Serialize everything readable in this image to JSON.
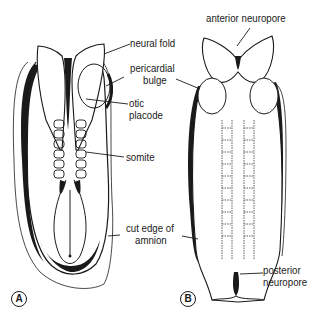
{
  "figure": {
    "panels": [
      {
        "id": "A",
        "letter": "A"
      },
      {
        "id": "B",
        "letter": "B"
      }
    ],
    "labels": {
      "neural_fold": "neural fold",
      "pericardial_bulge_1": "pericardial",
      "pericardial_bulge_2": "bulge",
      "otic_placode_1": "otic",
      "otic_placode_2": "placode",
      "somite": "somite",
      "cut_edge_1": "cut edge of",
      "cut_edge_2": "amnion",
      "anterior_neuropore": "anterior neuropore",
      "posterior_neuropore_1": "posterior",
      "posterior_neuropore_2": "neuropore"
    },
    "colors": {
      "ink": "#1a1a1a",
      "background": "#ffffff",
      "shade": "#7a7a7a"
    }
  }
}
